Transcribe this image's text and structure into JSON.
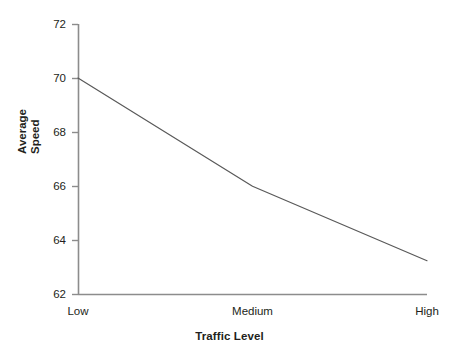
{
  "chart_data": {
    "type": "line",
    "title": "",
    "subtitle": "",
    "xlabel": "Traffic Level",
    "ylabel": "Average Speed",
    "categories": [
      "Low",
      "Medium",
      "High"
    ],
    "values": [
      70.0,
      66.0,
      63.25
    ],
    "series": [
      {
        "name": "Average Speed",
        "values": [
          70.0,
          66.0,
          63.25
        ]
      }
    ],
    "ylim": [
      62,
      72
    ],
    "ytick_labels": [
      "72",
      "70",
      "68",
      "66",
      "64",
      "62"
    ],
    "ytick_values": [
      72,
      70,
      68,
      66,
      64,
      62
    ],
    "xtick_labels": [
      "Low",
      "Medium",
      "High"
    ],
    "grid": false,
    "legend": false,
    "legend_position": "none",
    "colors": {
      "line": "#595959",
      "axis": "#8c8c8c",
      "text": "#231f20",
      "background": "#ffffff"
    }
  },
  "axes": {
    "y_title_line1": "Average",
    "y_title_line2": "Speed",
    "x_title": "Traffic Level"
  }
}
